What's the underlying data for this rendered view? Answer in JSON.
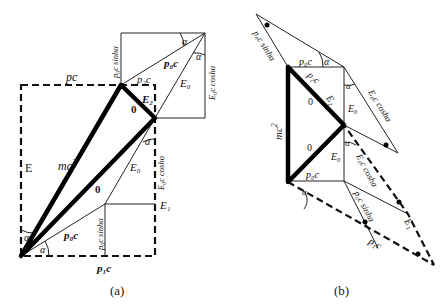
{
  "panel_a": {
    "caption": "(a)",
    "labels": {
      "pc": "pc",
      "E": "E",
      "mc2": "mc",
      "mc2_sup": "2",
      "p0c_sinh_top": "p₀c sinhα",
      "p0c_top": "p₀c",
      "p2c": "p₂c",
      "E2": "E₂",
      "zero_top": "0",
      "alpha_top1": "α",
      "alpha_top2": "α",
      "E0_top": "E₀",
      "E0c_cosh_top": "E₀c coshα",
      "alpha_mid": "α",
      "E0c_cosh_mid": "E₀c coshα",
      "E0_mid": "E₀",
      "zero_mid": "0",
      "E1": "E₁",
      "p0c_bottom": "p₀c",
      "p0c_sinh_bottom": "p₀c sinhα",
      "alpha_bl1": "α",
      "alpha_bl2": "α",
      "p1c": "p₁c"
    }
  },
  "panel_b": {
    "caption": "(b)",
    "labels": {
      "p0c_sinh_top": "p₀c sinhα",
      "p0c_top": "p₀c",
      "alpha_top": "α",
      "p2c": "p₂c",
      "E2": "E₂",
      "zero_top": "0",
      "E0_top": "E₀",
      "alpha_right": "α",
      "E0c_cosh_top": "E₀c coshα",
      "mc2": "mc",
      "mc2_sup": "2",
      "zero_bottom": "0",
      "E0_bottom": "E₀",
      "alpha_mid": "α",
      "E0c_cosh_mid": "E₀c coshα",
      "p0c_bottom": "p₀c",
      "alpha_bl": "α",
      "p0c_sinh_bottom": "p₀c sinhα",
      "E1": "E₁",
      "p1c": "p₁c"
    }
  }
}
